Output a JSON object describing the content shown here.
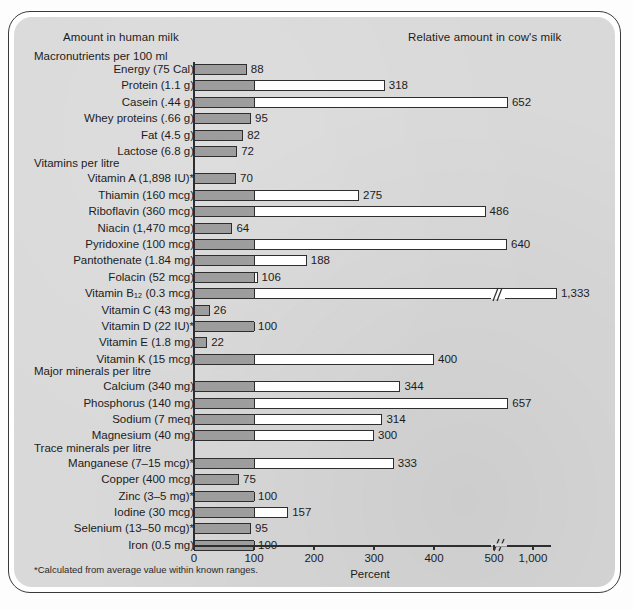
{
  "headers": {
    "left": "Amount in human milk",
    "right": "Relative amount in cow's milk"
  },
  "footnote": "*Calculated from average value within known ranges.",
  "chart_data": {
    "type": "bar",
    "title": "",
    "xlabel": "Percent",
    "ylabel": "",
    "orientation": "horizontal",
    "xlim": [
      0,
      1400
    ],
    "axis_ticks": [
      0,
      100,
      200,
      300,
      400,
      500,
      1000
    ],
    "axis_tick_labels": [
      "0",
      "100",
      "200",
      "300",
      "400",
      "500",
      "1,000"
    ],
    "axis_break_after": 500,
    "grid": false,
    "legend": null,
    "reference_value": 100,
    "reference_note": "Shaded portion of each bar represents 100 percent (the human-milk amount); the open portion shows the excess in cow's milk.",
    "sections": [
      {
        "heading": "Macronutrients per 100 ml",
        "rows": [
          {
            "label": "Energy (75 Cal)",
            "value": 88
          },
          {
            "label": "Protein (1.1 g)",
            "value": 318
          },
          {
            "label": "Casein (.44 g)",
            "value": 652
          },
          {
            "label": "Whey proteins (.66 g)",
            "value": 95
          },
          {
            "label": "Fat (4.5 g)",
            "value": 82
          },
          {
            "label": "Lactose (6.8 g)",
            "value": 72
          }
        ]
      },
      {
        "heading": "Vitamins per litre",
        "rows": [
          {
            "label": "Vitamin A (1,898 IU)*",
            "value": 70
          },
          {
            "label": "Thiamin (160 mcg)",
            "value": 275
          },
          {
            "label": "Riboflavin (360 mcg)",
            "value": 486
          },
          {
            "label": "Niacin (1,470 mcg)",
            "value": 64
          },
          {
            "label": "Pyridoxine (100 mcg)",
            "value": 640
          },
          {
            "label": "Pantothenate (1.84 mg)",
            "value": 188
          },
          {
            "label": "Folacin (52 mcg)",
            "value": 106
          },
          {
            "label": "Vitamin B₁₂ (0.3 mcg)",
            "value": 1333,
            "broken": true,
            "value_text": "1,333"
          },
          {
            "label": "Vitamin C (43 mg)",
            "value": 26
          },
          {
            "label": "Vitamin D (22 IU)*",
            "value": 100
          },
          {
            "label": "Vitamin E (1.8 mg)",
            "value": 22
          },
          {
            "label": "Vitamin K (15 mcg)",
            "value": 400
          }
        ]
      },
      {
        "heading": "Major minerals per litre",
        "rows": [
          {
            "label": "Calcium (340 mg)",
            "value": 344
          },
          {
            "label": "Phosphorus (140 mg)",
            "value": 657
          },
          {
            "label": "Sodium (7 meq)",
            "value": 314
          },
          {
            "label": "Magnesium (40 mg)",
            "value": 300
          }
        ]
      },
      {
        "heading": "Trace minerals per litre",
        "rows": [
          {
            "label": "Manganese (7–15 mcg)*",
            "value": 333
          },
          {
            "label": "Copper (400 mcg)",
            "value": 75
          },
          {
            "label": "Zinc (3–5 mg)*",
            "value": 100
          },
          {
            "label": "Iodine (30 mcg)",
            "value": 157
          },
          {
            "label": "Selenium (13–50 mcg)*",
            "value": 95
          },
          {
            "label": "Iron (0.5 mg)",
            "value": 100
          }
        ]
      }
    ]
  },
  "colors": {
    "panel": "#d9d9d9",
    "bar_shaded": "#9d9d9d",
    "bar_open": "#ffffff",
    "ink": "#2e2e2e"
  }
}
